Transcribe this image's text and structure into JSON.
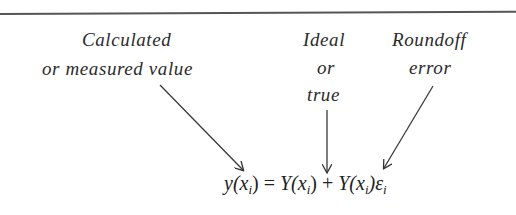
{
  "labels": {
    "calculated": {
      "line1": "Calculated",
      "line2": "or measured value"
    },
    "ideal": {
      "line1": "Ideal",
      "line2": "or",
      "line3": "true"
    },
    "roundoff": {
      "line1": "Roundoff",
      "line2": "error"
    }
  },
  "equation": {
    "lhs": "y(x",
    "lhs_sub": "i",
    "lhs_close": ")",
    "equals": " = ",
    "term1": "Y(x",
    "term1_sub": "i",
    "term1_close": ")",
    "plus": " + ",
    "term2": "Y(x",
    "term2_sub": "i",
    "term2_close": ")ε",
    "term2_eps_sub": "i"
  },
  "arrows": [
    {
      "from": "calculated",
      "to": "y(x_i)"
    },
    {
      "from": "ideal",
      "to": "Y(x_i)"
    },
    {
      "from": "roundoff",
      "to": "Y(x_i)ε_i"
    }
  ],
  "colors": {
    "ink": "#2a2a2a",
    "rule": "#555555",
    "background": "#ffffff"
  }
}
